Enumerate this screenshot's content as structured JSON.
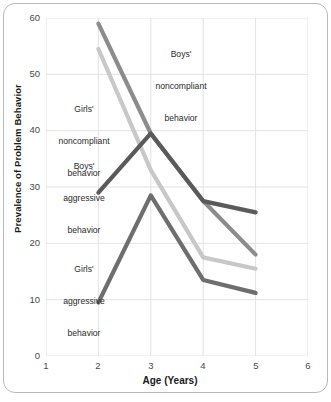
{
  "chart_data": {
    "type": "line",
    "title": "",
    "xlabel": "Age (Years)",
    "ylabel": "Prevalence of Problem Behavior",
    "x": [
      2,
      3,
      4,
      5
    ],
    "xlim": [
      1,
      6
    ],
    "ylim": [
      0,
      60
    ],
    "xticks": [
      "1",
      "2",
      "3",
      "4",
      "5",
      "6"
    ],
    "yticks": [
      "0",
      "10",
      "20",
      "30",
      "40",
      "50",
      "60"
    ],
    "grid": "on",
    "legend_position": "inline-annotations",
    "series": [
      {
        "name": "Boys' noncompliant behavior",
        "color": "#8c8c8c",
        "values": [
          59,
          39.5,
          27.5,
          18
        ]
      },
      {
        "name": "Girls' noncompliant behavior",
        "color": "#c8c8c8",
        "values": [
          54.5,
          33,
          17.5,
          15.5
        ]
      },
      {
        "name": "Boys' aggressive behavior",
        "color": "#5a5a5a",
        "values": [
          29,
          39.5,
          27.5,
          25.5
        ]
      },
      {
        "name": "Girls' aggressive behavior",
        "color": "#6e6e6e",
        "values": [
          9.5,
          28.5,
          13.5,
          11.2
        ]
      }
    ],
    "annotations": [
      {
        "key": "boys_noncompliant",
        "text": "Boys'\nnoncompliant\nbehavior"
      },
      {
        "key": "girls_noncompliant",
        "text": "Girls'\nnoncompliant\nbehavior"
      },
      {
        "key": "boys_aggressive",
        "text": "Boys'\naggressive\nbehavior"
      },
      {
        "key": "girls_aggressive",
        "text": "Girls'\naggressive\nbehavior"
      }
    ]
  },
  "axes": {
    "y_tick_labels": [
      "60",
      "50",
      "40",
      "30",
      "20",
      "10",
      "0"
    ],
    "x_tick_labels": [
      "1",
      "2",
      "3",
      "4",
      "5",
      "6"
    ],
    "x_title": "Age (Years)",
    "y_title": "Prevalence of Problem Behavior"
  },
  "annotations": {
    "boys_noncompliant_l1": "Boys'",
    "boys_noncompliant_l2": "noncompliant",
    "boys_noncompliant_l3": "behavior",
    "girls_noncompliant_l1": "Girls'",
    "girls_noncompliant_l2": "noncompliant",
    "girls_noncompliant_l3": "behavior",
    "boys_aggressive_l1": "Boys'",
    "boys_aggressive_l2": "aggressive",
    "boys_aggressive_l3": "behavior",
    "girls_aggressive_l1": "Girls'",
    "girls_aggressive_l2": "aggressive",
    "girls_aggressive_l3": "behavior"
  },
  "colors": {
    "boys_noncompliant": "#8c8c8c",
    "girls_noncompliant": "#c8c8c8",
    "boys_aggressive": "#5a5a5a",
    "girls_aggressive": "#6e6e6e",
    "grid": "#e3e3e3",
    "frame": "#b9b9b9",
    "text": "#1a1a1a"
  }
}
